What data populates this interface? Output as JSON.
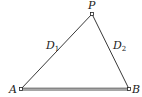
{
  "diagram": {
    "type": "triangle",
    "points": {
      "P": {
        "label": "P",
        "x": 92,
        "y": 14
      },
      "A": {
        "label": "A",
        "x": 21,
        "y": 89
      },
      "B": {
        "label": "B",
        "x": 129,
        "y": 89
      }
    },
    "edges": [
      {
        "from": "A",
        "to": "P",
        "label": "D",
        "label_sub": "1"
      },
      {
        "from": "P",
        "to": "B",
        "label": "D",
        "label_sub": "2"
      },
      {
        "from": "A",
        "to": "B",
        "label": "",
        "style": "double"
      }
    ],
    "colors": {
      "line": "#222222",
      "background": "#ffffff"
    }
  }
}
